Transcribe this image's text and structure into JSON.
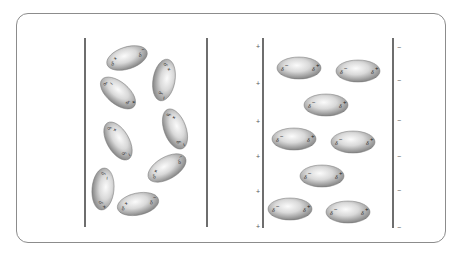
{
  "diagram": {
    "title": "",
    "panels": [
      {
        "id": "no-field",
        "description": "Polar molecules randomly oriented between uncharged plates",
        "left_plate": {
          "x": 85,
          "y1": 38,
          "y2": 227,
          "label": ""
        },
        "right_plate": {
          "x": 207,
          "y1": 38,
          "y2": 227,
          "label": ""
        },
        "molecules": [
          {
            "cx": 127,
            "cy": 58,
            "rx": 21,
            "ry": 11,
            "angle": -18,
            "pos_label": "δ+",
            "neg_label": "δ−",
            "pos_end": "left",
            "pos_sign": "+",
            "neg_sign": "−"
          },
          {
            "cx": 164,
            "cy": 80,
            "rx": 21,
            "ry": 11,
            "angle": 100,
            "pos_label": "δ+",
            "neg_label": "δ−",
            "pos_end": "left",
            "pos_sign": "+",
            "neg_sign": "−"
          },
          {
            "cx": 118,
            "cy": 93,
            "rx": 21,
            "ry": 11,
            "angle": 40,
            "pos_label": "δ−",
            "neg_label": "δ+",
            "pos_end": "right",
            "pos_sign": "+",
            "neg_sign": "−"
          },
          {
            "cx": 175,
            "cy": 129,
            "rx": 21,
            "ry": 11,
            "angle": 70,
            "pos_label": "δ+",
            "neg_label": "δ−",
            "pos_end": "left",
            "pos_sign": "+",
            "neg_sign": "−"
          },
          {
            "cx": 118,
            "cy": 141,
            "rx": 21,
            "ry": 11,
            "angle": 60,
            "pos_label": "δ+",
            "neg_label": "δ−",
            "pos_end": "right",
            "pos_sign": "+",
            "neg_sign": "−"
          },
          {
            "cx": 167,
            "cy": 168,
            "rx": 21,
            "ry": 11,
            "angle": -30,
            "pos_label": "δ+",
            "neg_label": "δ−",
            "pos_end": "right",
            "pos_sign": "+",
            "neg_sign": "−"
          },
          {
            "cx": 103,
            "cy": 189,
            "rx": 21,
            "ry": 11,
            "angle": 95,
            "pos_label": "δ−",
            "neg_label": "δ+",
            "pos_end": "left",
            "pos_sign": "+",
            "neg_sign": "−"
          },
          {
            "cx": 138,
            "cy": 204,
            "rx": 21,
            "ry": 11,
            "angle": -12,
            "pos_label": "δ+",
            "neg_label": "δ−",
            "pos_end": "right",
            "pos_sign": "+",
            "neg_sign": "−"
          }
        ]
      },
      {
        "id": "with-field",
        "description": "Polar molecules aligned between charged plates",
        "left_plate": {
          "x": 263,
          "y1": 38,
          "y2": 228,
          "label": "+",
          "charges": [
            "+",
            "+",
            "+",
            "+",
            "+",
            "+"
          ],
          "charge_y": [
            47,
            84,
            122,
            157,
            192,
            227
          ]
        },
        "right_plate": {
          "x": 393,
          "y1": 38,
          "y2": 228,
          "label": "−",
          "charges": [
            "−",
            "−",
            "−",
            "−",
            "−",
            "−"
          ],
          "charge_y": [
            48,
            81,
            121,
            157,
            191,
            228
          ]
        },
        "molecules": [
          {
            "cx": 299,
            "cy": 68,
            "rx": 22,
            "ry": 11,
            "angle": 0,
            "pos_label": "δ−",
            "neg_label": "δ+",
            "pos_end": "right"
          },
          {
            "cx": 358,
            "cy": 71,
            "rx": 22,
            "ry": 11,
            "angle": 0,
            "pos_label": "δ−",
            "neg_label": "δ+",
            "pos_end": "right"
          },
          {
            "cx": 326,
            "cy": 105,
            "rx": 22,
            "ry": 11,
            "angle": 0,
            "pos_label": "δ−",
            "neg_label": "δ+",
            "pos_end": "right"
          },
          {
            "cx": 294,
            "cy": 139,
            "rx": 22,
            "ry": 11,
            "angle": 0,
            "pos_label": "δ−",
            "neg_label": "δ+",
            "pos_end": "right"
          },
          {
            "cx": 353,
            "cy": 142,
            "rx": 22,
            "ry": 11,
            "angle": 0,
            "pos_label": "δ−",
            "neg_label": "δ+",
            "pos_end": "right"
          },
          {
            "cx": 322,
            "cy": 176,
            "rx": 22,
            "ry": 11,
            "angle": 0,
            "pos_label": "δ−",
            "neg_label": "δ+",
            "pos_end": "right"
          },
          {
            "cx": 290,
            "cy": 209,
            "rx": 22,
            "ry": 11,
            "angle": 0,
            "pos_label": "δ−",
            "neg_label": "δ+",
            "pos_end": "right"
          },
          {
            "cx": 348,
            "cy": 212,
            "rx": 22,
            "ry": 11,
            "angle": 0,
            "pos_label": "δ−",
            "neg_label": "δ+",
            "pos_end": "right"
          }
        ]
      }
    ],
    "colors": {
      "frame_border": "#8c8c8c",
      "plate": "#4a4a4a",
      "molecule_light": "#f4f4f4",
      "molecule_dark": "#8e8e8e"
    }
  }
}
